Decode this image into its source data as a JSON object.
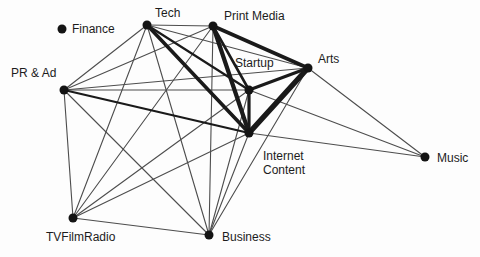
{
  "figure": {
    "background": "#fdfdfd",
    "text_color": "#1c1c1c",
    "node_color": "#141414",
    "edge_color_thin": "#4d4d4d",
    "edge_color_thick": "#1a1a1a",
    "node_radius": 4.5,
    "font_size": 12
  },
  "chart_data": {
    "type": "network",
    "title": "",
    "layout": "force-directed scatter, white background, no axes, no legend",
    "nodes": [
      {
        "id": "finance",
        "label": "Finance",
        "x": 62,
        "y": 29,
        "label_dx": 10,
        "label_dy": 4,
        "anchor": "start"
      },
      {
        "id": "tech",
        "label": "Tech",
        "x": 147,
        "y": 25,
        "label_dx": 8,
        "label_dy": -8,
        "anchor": "start"
      },
      {
        "id": "print_media",
        "label": "Print Media",
        "x": 213,
        "y": 26,
        "label_dx": 11,
        "label_dy": -6,
        "anchor": "start"
      },
      {
        "id": "pr_ad",
        "label": "PR & Ad",
        "x": 64,
        "y": 90,
        "label_dx": -53,
        "label_dy": -13,
        "anchor": "start"
      },
      {
        "id": "startup",
        "label": "Startup",
        "x": 249,
        "y": 90,
        "label_dx": -14,
        "label_dy": -23,
        "anchor": "start"
      },
      {
        "id": "arts",
        "label": "Arts",
        "x": 308,
        "y": 68,
        "label_dx": 10,
        "label_dy": -5,
        "anchor": "start"
      },
      {
        "id": "internet",
        "label": "Internet Content",
        "label_lines": [
          "Internet",
          "Content"
        ],
        "x": 249,
        "y": 133,
        "label_dx": 14,
        "label_dy": 27,
        "anchor": "start"
      },
      {
        "id": "music",
        "label": "Music",
        "x": 425,
        "y": 157,
        "label_dx": 12,
        "label_dy": 5,
        "anchor": "start"
      },
      {
        "id": "tvfilmradio",
        "label": "TVFilmRadio",
        "x": 73,
        "y": 218,
        "label_dx": -27,
        "label_dy": 23,
        "anchor": "start"
      },
      {
        "id": "business",
        "label": "Business",
        "x": 209,
        "y": 235,
        "label_dx": 13,
        "label_dy": 6,
        "anchor": "start"
      }
    ],
    "edges": [
      {
        "from": "tech",
        "to": "print_media",
        "w": 1.1
      },
      {
        "from": "tech",
        "to": "startup",
        "w": 2.2
      },
      {
        "from": "tech",
        "to": "arts",
        "w": 1.1
      },
      {
        "from": "tech",
        "to": "internet",
        "w": 3.6
      },
      {
        "from": "tech",
        "to": "pr_ad",
        "w": 1.1
      },
      {
        "from": "tech",
        "to": "tvfilmradio",
        "w": 1.1
      },
      {
        "from": "tech",
        "to": "business",
        "w": 1.1
      },
      {
        "from": "print_media",
        "to": "startup",
        "w": 2.6
      },
      {
        "from": "print_media",
        "to": "arts",
        "w": 3.6
      },
      {
        "from": "print_media",
        "to": "internet",
        "w": 4.2
      },
      {
        "from": "print_media",
        "to": "pr_ad",
        "w": 1.1
      },
      {
        "from": "print_media",
        "to": "tvfilmradio",
        "w": 1.1
      },
      {
        "from": "print_media",
        "to": "business",
        "w": 1.1
      },
      {
        "from": "startup",
        "to": "arts",
        "w": 3.0
      },
      {
        "from": "startup",
        "to": "internet",
        "w": 3.2
      },
      {
        "from": "startup",
        "to": "music",
        "w": 1.1
      },
      {
        "from": "startup",
        "to": "business",
        "w": 1.1
      },
      {
        "from": "startup",
        "to": "pr_ad",
        "w": 1.1
      },
      {
        "from": "startup",
        "to": "tvfilmradio",
        "w": 1.1
      },
      {
        "from": "arts",
        "to": "internet",
        "w": 5.5
      },
      {
        "from": "arts",
        "to": "music",
        "w": 1.1
      },
      {
        "from": "arts",
        "to": "business",
        "w": 1.1
      },
      {
        "from": "arts",
        "to": "pr_ad",
        "w": 1.1
      },
      {
        "from": "internet",
        "to": "pr_ad",
        "w": 2.2
      },
      {
        "from": "internet",
        "to": "music",
        "w": 1.1
      },
      {
        "from": "internet",
        "to": "business",
        "w": 1.1
      },
      {
        "from": "internet",
        "to": "tvfilmradio",
        "w": 1.1
      },
      {
        "from": "pr_ad",
        "to": "tvfilmradio",
        "w": 1.1
      },
      {
        "from": "pr_ad",
        "to": "business",
        "w": 1.1
      },
      {
        "from": "tvfilmradio",
        "to": "business",
        "w": 1.1
      }
    ]
  }
}
